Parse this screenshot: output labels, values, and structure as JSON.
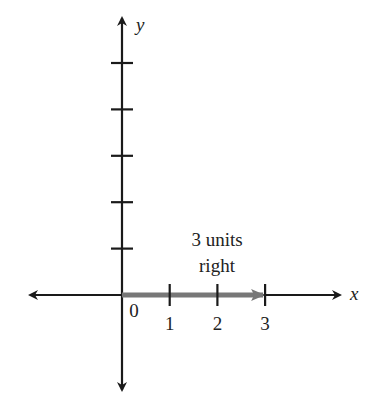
{
  "diagram": {
    "type": "coordinate-plane-translation",
    "axes": {
      "x_label": "x",
      "y_label": "y",
      "x_ticks": [
        {
          "value": 0,
          "label": "0"
        },
        {
          "value": 1,
          "label": "1"
        },
        {
          "value": 2,
          "label": "2"
        },
        {
          "value": 3,
          "label": "3"
        }
      ],
      "y_ticks": [
        1,
        2,
        3,
        4,
        5
      ]
    },
    "translation": {
      "from": 0,
      "to": 3,
      "direction": "right",
      "label_line1": "3 units",
      "label_line2": "right",
      "color": "#777777"
    },
    "axis_color": "#1a1a1a"
  }
}
